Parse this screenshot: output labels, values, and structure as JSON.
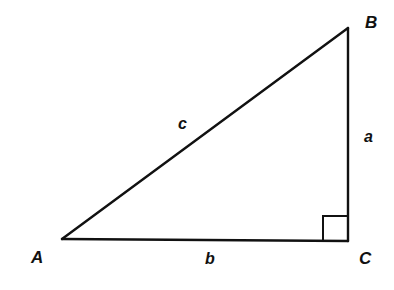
{
  "diagram": {
    "type": "right-triangle",
    "vertices": {
      "A": {
        "label": "A",
        "x": 62,
        "y": 239
      },
      "B": {
        "label": "B",
        "x": 348,
        "y": 28
      },
      "C": {
        "label": "C",
        "x": 348,
        "y": 241
      }
    },
    "sides": {
      "a": {
        "label": "a",
        "between": [
          "B",
          "C"
        ]
      },
      "b": {
        "label": "b",
        "between": [
          "A",
          "C"
        ]
      },
      "c": {
        "label": "c",
        "between": [
          "A",
          "B"
        ]
      }
    },
    "right_angle_at": "C",
    "stroke_color": "#111111",
    "background": "#ffffff"
  }
}
